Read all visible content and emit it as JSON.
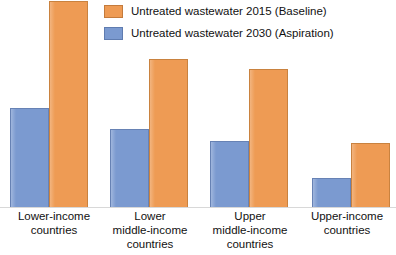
{
  "chart_data": {
    "type": "bar",
    "title": "",
    "subtitle": "",
    "xlabel": "",
    "ylabel": "",
    "grid": false,
    "legend_position": "top-center",
    "axis_visible": false,
    "ylim": [
      0,
      100
    ],
    "categories": [
      "Lower-income\ncountries",
      "Lower\nmiddle-income\ncountries",
      "Upper\nmiddle-income\ncountries",
      "Upper-income\ncountries"
    ],
    "series": [
      {
        "name": "Untreated wastewater 2015 (Baseline)",
        "color": "#EE9B54",
        "values": [
          100,
          72,
          67,
          31
        ]
      },
      {
        "name": "Untreated wastewater 2030 (Aspiration)",
        "color": "#7B9AD0",
        "values": [
          48,
          38,
          32,
          14
        ]
      }
    ]
  },
  "legend": {
    "items": [
      {
        "label": "Untreated wastewater 2015 (Baseline)",
        "swatch": "series-orange"
      },
      {
        "label": "Untreated wastewater 2030 (Aspiration)",
        "swatch": "series-blue"
      }
    ]
  },
  "categories": [
    {
      "line1": "Lower-income",
      "line2": "countries",
      "line3": ""
    },
    {
      "line1": "Lower",
      "line2": "middle-income",
      "line3": "countries"
    },
    {
      "line1": "Upper",
      "line2": "middle-income",
      "line3": "countries"
    },
    {
      "line1": "Upper-income",
      "line2": "countries",
      "line3": ""
    }
  ],
  "colors": {
    "baseline": "#EE9B54",
    "aspiration": "#7B9AD0",
    "background": "#FFFFFF",
    "text": "#111111"
  }
}
